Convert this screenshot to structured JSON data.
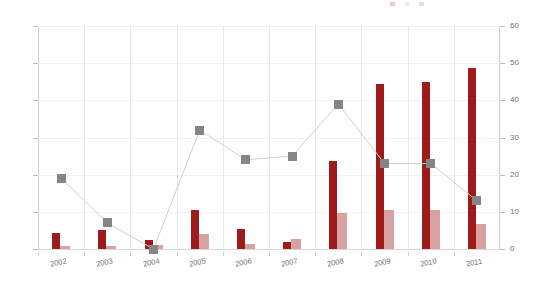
{
  "chart_data": {
    "type": "bar",
    "title": "",
    "subtitle": "",
    "xlabel": "",
    "ylabel": "",
    "categories": [
      "2002",
      "2003",
      "2004",
      "2005",
      "2006",
      "2007",
      "2008",
      "2009",
      "2010",
      "2011"
    ],
    "series": [
      {
        "name": "Series 1",
        "type": "bar",
        "axis": "left",
        "color": "#9d1b1b",
        "values": [
          22,
          26,
          12,
          53,
          27,
          10,
          118,
          222,
          225,
          243
        ]
      },
      {
        "name": "Series 2",
        "type": "bar",
        "axis": "left",
        "color": "#d8a2a2",
        "values": [
          4,
          4,
          6,
          20,
          7,
          14,
          48,
          52,
          53,
          33
        ]
      },
      {
        "name": "Series 3",
        "type": "line",
        "axis": "right",
        "color": "#858585",
        "marker": "square",
        "values": [
          19,
          7,
          0,
          32,
          24,
          25,
          39,
          23,
          23,
          13
        ]
      }
    ],
    "y_axis_left": {
      "min": 0,
      "max": 300,
      "ticks": [
        0,
        50,
        100,
        150,
        200,
        250,
        300
      ],
      "labels": [
        "0",
        "50",
        "100",
        "150",
        "200",
        "250",
        "300"
      ]
    },
    "y_axis_right": {
      "min": 0,
      "max": 60,
      "ticks": [
        0,
        10,
        20,
        30,
        40,
        50,
        60
      ],
      "labels": [
        "0",
        "10",
        "20",
        "30",
        "40",
        "50",
        "60"
      ]
    },
    "grid": {
      "horizontal": true,
      "vertical": true
    },
    "legend": {
      "position": "top-right",
      "visible": true,
      "clipped": true,
      "entries": [
        {
          "label": "",
          "color": "#9d1b1b"
        },
        {
          "label": "",
          "color": "#d8a2a2"
        },
        {
          "label": "",
          "color": "#858585"
        }
      ]
    }
  }
}
